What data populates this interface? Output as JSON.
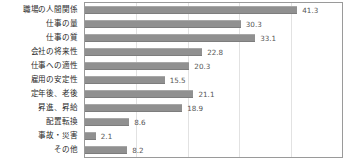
{
  "chart_data": {
    "type": "bar",
    "orientation": "horizontal",
    "title": "",
    "xlabel": "",
    "ylabel": "",
    "xlim": [
      0,
      50
    ],
    "xticks": [
      0,
      10,
      20,
      30,
      40,
      50
    ],
    "grid": true,
    "legend": false,
    "value_label_format": "one-decimal",
    "categories": [
      "職場の人間関係",
      "仕事の量",
      "仕事の質",
      "会社の将来性",
      "仕事への適性",
      "雇用の安定性",
      "定年後、老後",
      "昇進、昇給",
      "配置転換",
      "事故・災害",
      "その他"
    ],
    "values": [
      41.3,
      30.3,
      33.1,
      22.8,
      20.3,
      15.5,
      21.1,
      18.9,
      8.6,
      2.1,
      8.2
    ],
    "value_labels": [
      "41.3",
      "30.3",
      "33.1",
      "22.8",
      "20.3",
      "15.5",
      "21.1",
      "18.9",
      "8.6",
      "2.1",
      "8.2"
    ],
    "colors": {
      "bar": "#909090",
      "bar_edge_light": "#a8a8a8",
      "bar_edge_dark": "#7d7d7d",
      "gridline": "#e2e2e2",
      "plot_border": "#9a9a9a",
      "category_text": "#2b2b2b",
      "value_text": "#555555",
      "background": "#ffffff"
    }
  }
}
